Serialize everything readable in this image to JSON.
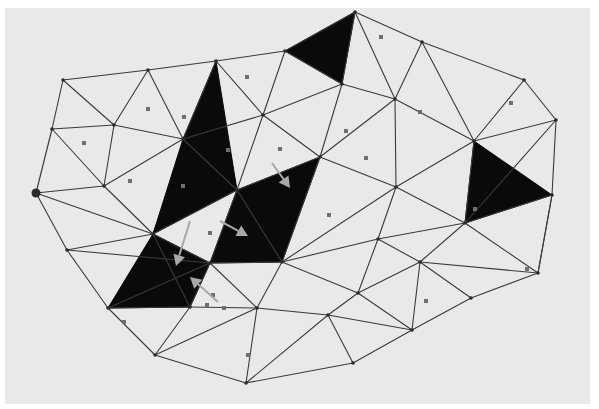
{
  "figure": {
    "background_color": "#e9e9e9",
    "paper_rect": {
      "x": 5,
      "y": 8,
      "w": 585,
      "h": 396
    },
    "edge_color": "#3a3a3a",
    "fill_color": "#0a0a0a",
    "arrow_color": "#a8a8a8",
    "sample_color": "#6f6f6f"
  },
  "mesh": {
    "vertices": [
      [
        63,
        80
      ],
      [
        148,
        70
      ],
      [
        216,
        61
      ],
      [
        285,
        51
      ],
      [
        355,
        12
      ],
      [
        422,
        42
      ],
      [
        524,
        80
      ],
      [
        556,
        120
      ],
      [
        552,
        195
      ],
      [
        538,
        273
      ],
      [
        471,
        298
      ],
      [
        412,
        330
      ],
      [
        353,
        363
      ],
      [
        246,
        383
      ],
      [
        155,
        355
      ],
      [
        108,
        308
      ],
      [
        67,
        250
      ],
      [
        36,
        193
      ],
      [
        52,
        129
      ],
      [
        114,
        125
      ],
      [
        183,
        139
      ],
      [
        263,
        115
      ],
      [
        342,
        84
      ],
      [
        395,
        99
      ],
      [
        320,
        157
      ],
      [
        396,
        187
      ],
      [
        474,
        141
      ],
      [
        104,
        186
      ],
      [
        153,
        234
      ],
      [
        237,
        190
      ],
      [
        210,
        263
      ],
      [
        282,
        262
      ],
      [
        378,
        239
      ],
      [
        358,
        293
      ],
      [
        465,
        223
      ],
      [
        257,
        308
      ],
      [
        328,
        315
      ],
      [
        190,
        307
      ],
      [
        420,
        262
      ]
    ],
    "start_vertex": 17,
    "edges": [
      [
        0,
        1
      ],
      [
        1,
        2
      ],
      [
        2,
        3
      ],
      [
        3,
        4
      ],
      [
        4,
        5
      ],
      [
        5,
        6
      ],
      [
        6,
        7
      ],
      [
        7,
        8
      ],
      [
        8,
        9
      ],
      [
        9,
        10
      ],
      [
        10,
        11
      ],
      [
        11,
        12
      ],
      [
        12,
        13
      ],
      [
        13,
        14
      ],
      [
        14,
        15
      ],
      [
        15,
        16
      ],
      [
        16,
        17
      ],
      [
        17,
        18
      ],
      [
        18,
        0
      ],
      [
        0,
        19
      ],
      [
        18,
        19
      ],
      [
        19,
        1
      ],
      [
        1,
        20
      ],
      [
        19,
        20
      ],
      [
        2,
        20
      ],
      [
        2,
        21
      ],
      [
        20,
        21
      ],
      [
        3,
        21
      ],
      [
        3,
        22
      ],
      [
        21,
        22
      ],
      [
        4,
        22
      ],
      [
        22,
        23
      ],
      [
        4,
        23
      ],
      [
        5,
        23
      ],
      [
        23,
        26
      ],
      [
        5,
        26
      ],
      [
        6,
        26
      ],
      [
        7,
        26
      ],
      [
        18,
        27
      ],
      [
        19,
        27
      ],
      [
        27,
        20
      ],
      [
        17,
        27
      ],
      [
        27,
        28
      ],
      [
        17,
        28
      ],
      [
        16,
        28
      ],
      [
        20,
        29
      ],
      [
        21,
        29
      ],
      [
        21,
        24
      ],
      [
        22,
        24
      ],
      [
        23,
        24
      ],
      [
        24,
        25
      ],
      [
        23,
        25
      ],
      [
        25,
        26
      ],
      [
        24,
        29
      ],
      [
        28,
        29
      ],
      [
        28,
        30
      ],
      [
        29,
        30
      ],
      [
        16,
        30
      ],
      [
        15,
        30
      ],
      [
        28,
        37
      ],
      [
        30,
        37
      ],
      [
        15,
        37
      ],
      [
        14,
        37
      ],
      [
        29,
        31
      ],
      [
        24,
        31
      ],
      [
        30,
        31
      ],
      [
        25,
        31
      ],
      [
        25,
        32
      ],
      [
        31,
        32
      ],
      [
        26,
        34
      ],
      [
        25,
        34
      ],
      [
        7,
        34
      ],
      [
        8,
        34
      ],
      [
        32,
        34
      ],
      [
        32,
        38
      ],
      [
        34,
        38
      ],
      [
        38,
        9
      ],
      [
        8,
        9
      ],
      [
        34,
        9
      ],
      [
        38,
        10
      ],
      [
        38,
        33
      ],
      [
        32,
        33
      ],
      [
        31,
        33
      ],
      [
        31,
        35
      ],
      [
        30,
        35
      ],
      [
        37,
        35
      ],
      [
        35,
        36
      ],
      [
        33,
        36
      ],
      [
        36,
        11
      ],
      [
        33,
        11
      ],
      [
        38,
        11
      ],
      [
        35,
        14
      ],
      [
        35,
        13
      ],
      [
        36,
        13
      ],
      [
        36,
        12
      ]
    ],
    "filled_triangles": [
      [
        3,
        4,
        22
      ],
      [
        2,
        20,
        28
      ],
      [
        2,
        28,
        29
      ],
      [
        29,
        24,
        31
      ],
      [
        30,
        29,
        31
      ],
      [
        28,
        30,
        37
      ],
      [
        26,
        34,
        8
      ],
      [
        28,
        37,
        15
      ]
    ],
    "sample_points": [
      [
        247,
        77
      ],
      [
        148,
        109
      ],
      [
        184,
        117
      ],
      [
        84,
        143
      ],
      [
        130,
        181
      ],
      [
        183,
        186
      ],
      [
        228,
        150
      ],
      [
        280,
        149
      ],
      [
        346,
        131
      ],
      [
        366,
        158
      ],
      [
        381,
        37
      ],
      [
        420,
        112
      ],
      [
        511,
        103
      ],
      [
        329,
        215
      ],
      [
        475,
        209
      ],
      [
        210,
        233
      ],
      [
        213,
        295
      ],
      [
        207,
        305
      ],
      [
        224,
        308
      ],
      [
        124,
        322
      ],
      [
        248,
        355
      ],
      [
        426,
        301
      ],
      [
        527,
        269
      ]
    ],
    "arrows": [
      {
        "from": [
          272,
          163
        ],
        "to": [
          290,
          188
        ]
      },
      {
        "from": [
          220,
          221
        ],
        "to": [
          248,
          236
        ]
      },
      {
        "from": [
          190,
          221
        ],
        "to": [
          176,
          266
        ]
      },
      {
        "from": [
          218,
          302
        ],
        "to": [
          190,
          277
        ]
      }
    ]
  }
}
